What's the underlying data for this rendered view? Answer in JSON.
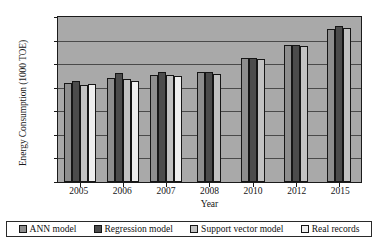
{
  "chart_data": {
    "type": "bar",
    "title": "",
    "xlabel": "Year",
    "ylabel": "Energy Consumption (1000 TOE)",
    "ylim": [
      0,
      35000
    ],
    "yticks": [
      0,
      5000,
      10000,
      15000,
      20000,
      25000,
      30000,
      35000
    ],
    "ytick_labels": [
      "0",
      "5000",
      "10000",
      "15000",
      "20000",
      "25000",
      "30000",
      "35000"
    ],
    "grid": true,
    "legend_position": "bottom",
    "categories": [
      "2005",
      "2006",
      "2007",
      "2008",
      "2010",
      "2012",
      "2015"
    ],
    "series": [
      {
        "name": "ANN model",
        "color": "#8e8e8e",
        "values": [
          21000,
          22000,
          22700,
          23300,
          26300,
          29000,
          32500
        ]
      },
      {
        "name": "Regression model",
        "color": "#4c4c4c",
        "values": [
          21500,
          23200,
          23300,
          23300,
          26400,
          29100,
          33000
        ]
      },
      {
        "name": "Support vector model",
        "color": "#c2c2c2",
        "values": [
          20600,
          21900,
          22700,
          23000,
          26200,
          28900,
          32700
        ]
      },
      {
        "name": "Real records",
        "color": "#efefef",
        "values": [
          20800,
          21500,
          22500,
          null,
          null,
          null,
          null
        ]
      }
    ]
  },
  "legend": {
    "items": [
      {
        "label": "ANN model",
        "color": "#8e8e8e"
      },
      {
        "label": "Regression model",
        "color": "#4c4c4c"
      },
      {
        "label": "Support vector model",
        "color": "#c2c2c2"
      },
      {
        "label": "Real records",
        "color": "#efefef"
      }
    ]
  }
}
